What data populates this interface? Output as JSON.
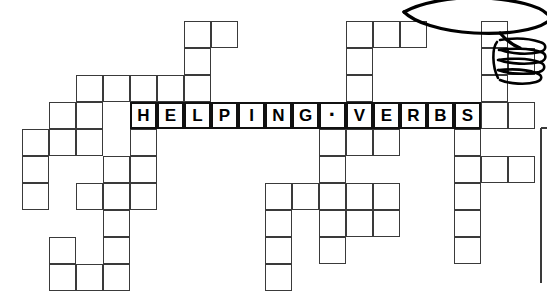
{
  "puzzle": {
    "title": "HELPING VERBS",
    "answer_text": "HELPING·VERBS",
    "grid": {
      "cell_size": 27,
      "origin_x": 22,
      "origin_y": 21,
      "rows": 10,
      "cols": 20,
      "line_color": "#3a3a3a",
      "letter_color": "#000000",
      "background": "#ffffff"
    },
    "answer_row_index": 3,
    "letters": [
      {
        "col": 4,
        "char": "H"
      },
      {
        "col": 5,
        "char": "E"
      },
      {
        "col": 6,
        "char": "L"
      },
      {
        "col": 7,
        "char": "P"
      },
      {
        "col": 8,
        "char": "I"
      },
      {
        "col": 9,
        "char": "N"
      },
      {
        "col": 10,
        "char": "G"
      },
      {
        "col": 11,
        "char": "·"
      },
      {
        "col": 12,
        "char": "V"
      },
      {
        "col": 13,
        "char": "E"
      },
      {
        "col": 14,
        "char": "R"
      },
      {
        "col": 15,
        "char": "B"
      },
      {
        "col": 16,
        "char": "S"
      }
    ],
    "cells": [
      [
        6,
        0
      ],
      [
        7,
        0
      ],
      [
        12,
        0
      ],
      [
        13,
        0
      ],
      [
        14,
        0
      ],
      [
        17,
        0
      ],
      [
        6,
        1
      ],
      [
        12,
        1
      ],
      [
        17,
        1
      ],
      [
        18,
        1
      ],
      [
        2,
        2
      ],
      [
        3,
        2
      ],
      [
        4,
        2
      ],
      [
        5,
        2
      ],
      [
        6,
        2
      ],
      [
        12,
        2
      ],
      [
        17,
        2
      ],
      [
        1,
        3
      ],
      [
        2,
        3
      ],
      [
        4,
        3
      ],
      [
        5,
        3
      ],
      [
        6,
        3
      ],
      [
        7,
        3
      ],
      [
        8,
        3
      ],
      [
        9,
        3
      ],
      [
        10,
        3
      ],
      [
        11,
        3
      ],
      [
        12,
        3
      ],
      [
        13,
        3
      ],
      [
        14,
        3
      ],
      [
        15,
        3
      ],
      [
        16,
        3
      ],
      [
        17,
        3
      ],
      [
        18,
        3
      ],
      [
        0,
        4
      ],
      [
        1,
        4
      ],
      [
        2,
        4
      ],
      [
        4,
        4
      ],
      [
        11,
        4
      ],
      [
        12,
        4
      ],
      [
        13,
        4
      ],
      [
        16,
        4
      ],
      [
        0,
        5
      ],
      [
        3,
        5
      ],
      [
        4,
        5
      ],
      [
        11,
        5
      ],
      [
        16,
        5
      ],
      [
        17,
        5
      ],
      [
        18,
        5
      ],
      [
        0,
        6
      ],
      [
        2,
        6
      ],
      [
        3,
        6
      ],
      [
        4,
        6
      ],
      [
        9,
        6
      ],
      [
        10,
        6
      ],
      [
        11,
        6
      ],
      [
        12,
        6
      ],
      [
        13,
        6
      ],
      [
        16,
        6
      ],
      [
        3,
        7
      ],
      [
        11,
        7
      ],
      [
        12,
        7
      ],
      [
        13,
        7
      ],
      [
        9,
        7
      ],
      [
        16,
        7
      ],
      [
        1,
        8
      ],
      [
        3,
        8
      ],
      [
        9,
        8
      ],
      [
        11,
        8
      ],
      [
        16,
        8
      ],
      [
        1,
        9
      ],
      [
        2,
        9
      ],
      [
        3,
        9
      ],
      [
        9,
        9
      ]
    ]
  },
  "artwork": {
    "name": "cartoon-hand-illustration",
    "description": "line drawing of a hand and arm at top right",
    "stroke_color": "#000000"
  },
  "page_border": {
    "name": "page-edge-rule",
    "color": "#3a3a3a"
  }
}
